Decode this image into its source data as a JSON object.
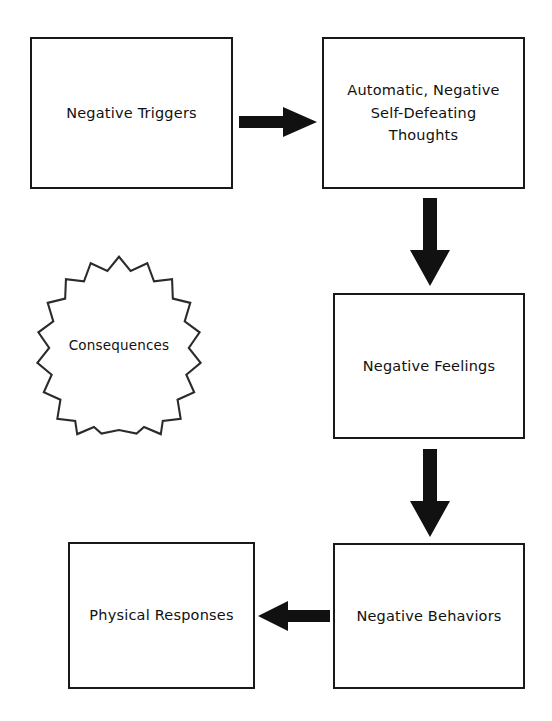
{
  "diagram": {
    "background_color": "#ffffff",
    "line_color": "#191919",
    "arrow_color": "#111111",
    "nodes": [
      {
        "id": "triggers",
        "shape": "rectangle",
        "label": "Negative Triggers"
      },
      {
        "id": "thoughts",
        "shape": "rectangle",
        "label": "Automatic, Negative\nSelf-Defeating\nThoughts"
      },
      {
        "id": "feelings",
        "shape": "rectangle",
        "label": "Negative Feelings"
      },
      {
        "id": "behaviors",
        "shape": "rectangle",
        "label": "Negative Behaviors"
      },
      {
        "id": "physical",
        "shape": "rectangle",
        "label": "Physical Responses"
      },
      {
        "id": "consequences",
        "shape": "starburst",
        "points": 20,
        "label": "Consequences"
      }
    ],
    "arrows": [
      {
        "id": "triggers-to-thoughts",
        "from": "triggers",
        "to": "thoughts",
        "direction": "right"
      },
      {
        "id": "thoughts-to-feelings",
        "from": "thoughts",
        "to": "feelings",
        "direction": "down"
      },
      {
        "id": "feelings-to-behaviors",
        "from": "feelings",
        "to": "behaviors",
        "direction": "down"
      },
      {
        "id": "behaviors-to-physical",
        "from": "behaviors",
        "to": "physical",
        "direction": "left"
      }
    ]
  }
}
